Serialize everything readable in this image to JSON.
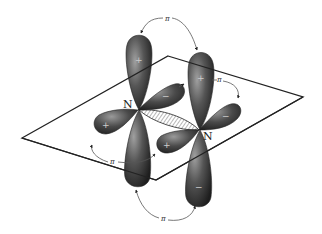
{
  "diagram": {
    "atoms": [
      {
        "id": "N1",
        "label": "N"
      },
      {
        "id": "N2",
        "label": "N"
      }
    ],
    "bond_labels": [
      {
        "id": "pi-top",
        "label": "π"
      },
      {
        "id": "pi-right",
        "label": "π"
      },
      {
        "id": "pi-left",
        "label": "π"
      },
      {
        "id": "pi-bottom",
        "label": "π"
      }
    ],
    "lobe_signs": {
      "n1_upper": "+",
      "n1_lower": "−",
      "n1_left": "+",
      "n1_right": "−",
      "n2_upper": "+",
      "n2_lower": "−",
      "n2_left": "+",
      "n2_right": "−"
    },
    "colors": {
      "lobe_dark": "#2a2a2a",
      "lobe_light": "#9a9a9a",
      "line": "#222222",
      "background": "#ffffff"
    }
  }
}
